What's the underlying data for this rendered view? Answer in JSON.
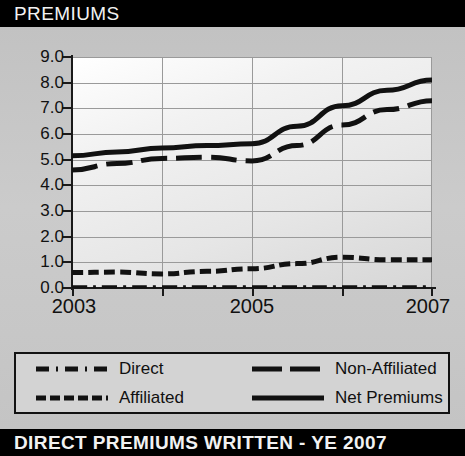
{
  "header": {
    "title": "PREMIUMS"
  },
  "footer": {
    "title": "DIRECT PREMIUMS WRITTEN - YE 2007"
  },
  "footnote": {
    "source_note": "See Sec. 2, B.3",
    "units_note": "$ Millions"
  },
  "legend": {
    "position": "below-plot",
    "items": [
      {
        "label": "Direct",
        "style": "dash-dot",
        "color": "#111111"
      },
      {
        "label": "Non-Affiliated",
        "style": "long-dash",
        "color": "#111111"
      },
      {
        "label": "Affiliated",
        "style": "short-dash",
        "color": "#111111"
      },
      {
        "label": "Net Premiums",
        "style": "solid",
        "color": "#111111"
      }
    ]
  },
  "chart_data": {
    "type": "line",
    "title": "PREMIUMS",
    "xlabel": "",
    "ylabel": "",
    "units": "$ Millions",
    "grid": true,
    "legend_position": "below",
    "x": [
      2003,
      2003.5,
      2004,
      2004.5,
      2005,
      2005.5,
      2006,
      2006.5,
      2007
    ],
    "x_tick_values": [
      2003,
      2004,
      2005,
      2006,
      2007
    ],
    "x_tick_labels": [
      "2003",
      "",
      "2005",
      "",
      "2007"
    ],
    "xlim": [
      2003,
      2007
    ],
    "ylim": [
      0.0,
      9.0
    ],
    "y_ticks": [
      0.0,
      1.0,
      2.0,
      3.0,
      4.0,
      5.0,
      6.0,
      7.0,
      8.0,
      9.0
    ],
    "y_tick_labels": [
      "0.0",
      "1.0",
      "2.0",
      "3.0",
      "4.0",
      "5.0",
      "6.0",
      "7.0",
      "8.0",
      "9.0"
    ],
    "series": [
      {
        "name": "Net Premiums",
        "style": "solid",
        "color": "#111111",
        "values": [
          5.15,
          5.3,
          5.45,
          5.55,
          5.62,
          6.3,
          7.1,
          7.7,
          8.1
        ]
      },
      {
        "name": "Non-Affiliated",
        "style": "long-dash",
        "color": "#111111",
        "values": [
          4.6,
          4.85,
          5.05,
          5.1,
          4.95,
          5.55,
          6.35,
          6.95,
          7.3
        ]
      },
      {
        "name": "Affiliated",
        "style": "short-dash",
        "color": "#111111",
        "values": [
          0.6,
          0.62,
          0.55,
          0.65,
          0.75,
          0.95,
          1.2,
          1.1,
          1.1
        ]
      },
      {
        "name": "Direct",
        "style": "dash-dot",
        "color": "#111111",
        "values": [
          0.05,
          0.05,
          0.05,
          0.05,
          0.05,
          0.05,
          0.05,
          0.05,
          0.05
        ]
      }
    ]
  }
}
